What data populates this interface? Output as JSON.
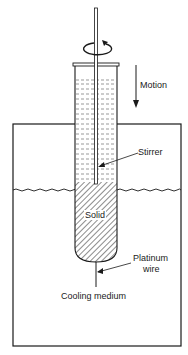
{
  "diagram": {
    "labels": {
      "motion": "Motion",
      "stirrer": "Stirrer",
      "solid": "Solid",
      "platinum_wire_line1": "Platinum",
      "platinum_wire_line2": "wire",
      "cooling_medium": "Cooling medium"
    },
    "components": [
      "rotating stirrer rod",
      "rotation arrow",
      "test tube with liquid",
      "solid phase (hatched)",
      "outer cooling bath",
      "liquid surface (wavy)",
      "platinum wire",
      "motion arrow"
    ],
    "colors": {
      "line": "#1a1a1a",
      "background": "#ffffff"
    }
  }
}
